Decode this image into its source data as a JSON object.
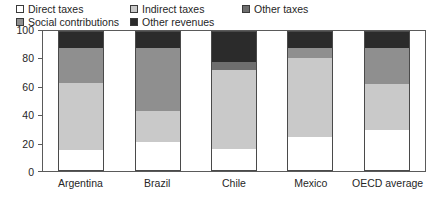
{
  "chart_data": {
    "type": "bar",
    "title": "",
    "subtitle": "",
    "xlabel": "",
    "ylabel": "",
    "ylim": [
      0,
      100
    ],
    "yticks": [
      "0",
      "20",
      "40",
      "60",
      "80",
      "100"
    ],
    "grid": false,
    "stacked": true,
    "stack_total": 100,
    "units": "percent",
    "legend_position": "top-left",
    "categories": [
      "Argentina",
      "Brazil",
      "Chile",
      "Mexico",
      "OECD average"
    ],
    "series": [
      {
        "name": "Direct taxes",
        "color": "#ffffff",
        "values": [
          15,
          21,
          16,
          24,
          29
        ]
      },
      {
        "name": "Indirect taxes",
        "color": "#c9c9c9",
        "values": [
          48,
          22,
          56,
          57,
          33
        ]
      },
      {
        "name": "Social contributions",
        "color": "#8f8f8f",
        "values": [
          25,
          45,
          0,
          7,
          26
        ]
      },
      {
        "name": "Other taxes",
        "color": "#6e6e6e",
        "values": [
          0,
          0,
          6,
          0,
          0
        ]
      },
      {
        "name": "Other revenues",
        "color": "#2b2b2b",
        "values": [
          12,
          12,
          22,
          12,
          12
        ]
      }
    ]
  },
  "legend": {
    "row1": [
      {
        "label": "Direct taxes",
        "color": "#ffffff",
        "left": 0
      },
      {
        "label": "Indirect taxes",
        "color": "#c9c9c9",
        "left": 114
      },
      {
        "label": "Other taxes",
        "color": "#6e6e6e",
        "left": 226
      }
    ],
    "row2": [
      {
        "label": "Social contributions",
        "color": "#8f8f8f",
        "left": 0
      },
      {
        "label": "Other revenues",
        "color": "#2b2b2b",
        "left": 114
      }
    ]
  },
  "axis": {
    "y_ticks": [
      {
        "label": "100",
        "value": 100
      },
      {
        "label": "80",
        "value": 80
      },
      {
        "label": "60",
        "value": 60
      },
      {
        "label": "40",
        "value": 40
      },
      {
        "label": "20",
        "value": 20
      },
      {
        "label": "0",
        "value": 0
      }
    ],
    "x_labels": [
      "Argentina",
      "Brazil",
      "Chile",
      "Mexico",
      "OECD average"
    ]
  }
}
